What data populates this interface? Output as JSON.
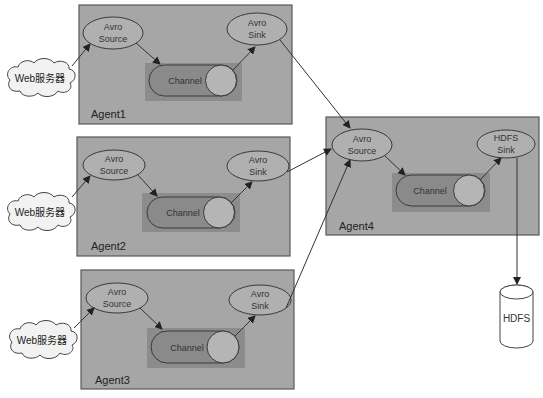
{
  "diagram": {
    "agents": [
      {
        "label": "Agent1",
        "source": "Avro\nSource",
        "source_l1": "Avro",
        "source_l2": "Source",
        "sink_l1": "Avro",
        "sink_l2": "Sink",
        "channel": "Channel",
        "client": "Web服务器"
      },
      {
        "label": "Agent2",
        "source_l1": "Avro",
        "source_l2": "Source",
        "sink_l1": "Avro",
        "sink_l2": "Sink",
        "channel": "Channel",
        "client": "Web服务器"
      },
      {
        "label": "Agent3",
        "source_l1": "Avro",
        "source_l2": "Source",
        "sink_l1": "Avro",
        "sink_l2": "Sink",
        "channel": "Channel",
        "client": "Web服务器"
      },
      {
        "label": "Agent4",
        "source_l1": "Avro",
        "source_l2": "Source",
        "sink_l1": "HDFS",
        "sink_l2": "Sink",
        "channel": "Channel"
      }
    ],
    "storage": {
      "label": "HDFS"
    },
    "edges": [
      [
        "Web服务器(1)",
        "Agent1.Avro Source"
      ],
      [
        "Agent1.Avro Source",
        "Agent1.Channel"
      ],
      [
        "Agent1.Channel",
        "Agent1.Avro Sink"
      ],
      [
        "Agent1.Avro Sink",
        "Agent4.Avro Source"
      ],
      [
        "Web服务器(2)",
        "Agent2.Avro Source"
      ],
      [
        "Agent2.Avro Source",
        "Agent2.Channel"
      ],
      [
        "Agent2.Channel",
        "Agent2.Avro Sink"
      ],
      [
        "Agent2.Avro Sink",
        "Agent4.Avro Source"
      ],
      [
        "Web服务器(3)",
        "Agent3.Avro Source"
      ],
      [
        "Agent3.Avro Source",
        "Agent3.Channel"
      ],
      [
        "Agent3.Channel",
        "Agent3.Avro Sink"
      ],
      [
        "Agent3.Avro Sink",
        "Agent4.Avro Source"
      ],
      [
        "Agent4.Avro Source",
        "Agent4.Channel"
      ],
      [
        "Agent4.Channel",
        "Agent4.HDFS Sink"
      ],
      [
        "Agent4.HDFS Sink",
        "HDFS"
      ]
    ],
    "colors": {
      "agent_fill": "#a6a6a6",
      "channel_fill": "#8a8a8a",
      "node_fill": "#b0b0b0"
    }
  }
}
